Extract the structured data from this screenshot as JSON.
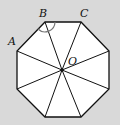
{
  "diagram": {
    "type": "regular-octagon",
    "background": "#d9d9d9",
    "fill": "#ffffff",
    "stroke": "#111111",
    "center": {
      "label": "O",
      "x": 62,
      "y": 70
    },
    "vertices": [
      {
        "label": "B",
        "x": 45,
        "y": 22
      },
      {
        "label": "C",
        "x": 81,
        "y": 22
      },
      {
        "label": "",
        "x": 109,
        "y": 51
      },
      {
        "label": "",
        "x": 109,
        "y": 89
      },
      {
        "label": "",
        "x": 81,
        "y": 117
      },
      {
        "label": "",
        "x": 45,
        "y": 117
      },
      {
        "label": "",
        "x": 17,
        "y": 89
      },
      {
        "label": "A",
        "x": 17,
        "y": 51
      }
    ],
    "labels": {
      "A": "A",
      "B": "B",
      "C": "C",
      "O": "O"
    },
    "angle_mark": {
      "at": "B",
      "between": [
        "A",
        "C"
      ],
      "style": "arc"
    }
  }
}
